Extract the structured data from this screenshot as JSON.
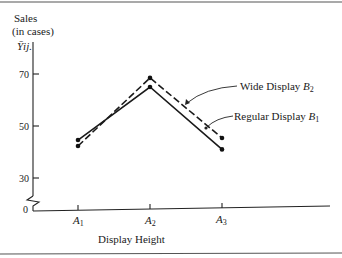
{
  "chart_data": {
    "type": "line",
    "title": "",
    "ylabel_line1": "Sales",
    "ylabel_line2": "(in cases)",
    "ylabel_symbol": "Ȳij.",
    "xlabel": "Display Height",
    "categories": [
      "A1",
      "A2",
      "A3"
    ],
    "category_labels": [
      {
        "base": "A",
        "sub": "1"
      },
      {
        "base": "A",
        "sub": "2"
      },
      {
        "base": "A",
        "sub": "3"
      }
    ],
    "yticks": [
      0,
      30,
      50,
      70
    ],
    "ytick_labels": [
      "0",
      "30",
      "50",
      "70"
    ],
    "axis_break": true,
    "grid": false,
    "series": [
      {
        "name": "Regular Display B1",
        "label_text": "Regular Display ",
        "label_base": "B",
        "label_sub": "1",
        "style": "solid",
        "values": [
          44.6,
          65,
          41
        ]
      },
      {
        "name": "Wide Display B2",
        "label_text": "Wide Display ",
        "label_base": "B",
        "label_sub": "2",
        "style": "dashed",
        "values": [
          42.3,
          68.5,
          45.4
        ]
      }
    ],
    "legend_position": "inline-annotations-right"
  }
}
